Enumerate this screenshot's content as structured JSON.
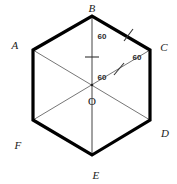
{
  "figure": {
    "background_color": "#ffffff",
    "outline_color": "#000000",
    "diagonal_color": "#555555",
    "tick_color": "#333333",
    "label_color": "#1a1a1a"
  },
  "vertices": [
    {
      "id": "A",
      "label": "A",
      "point_x": 33,
      "point_y": 50,
      "label_x": 15,
      "label_y": 45
    },
    {
      "id": "B",
      "label": "B",
      "point_x": 92,
      "point_y": 16,
      "label_x": 92,
      "label_y": 8
    },
    {
      "id": "C",
      "label": "C",
      "point_x": 150,
      "point_y": 50,
      "label_x": 164,
      "label_y": 47
    },
    {
      "id": "D",
      "label": "D",
      "point_x": 150,
      "point_y": 120,
      "label_x": 165,
      "label_y": 133
    },
    {
      "id": "E",
      "label": "E",
      "point_x": 92,
      "point_y": 155,
      "label_x": 96,
      "label_y": 175
    },
    {
      "id": "F",
      "label": "F",
      "point_x": 33,
      "point_y": 120,
      "label_x": 18,
      "label_y": 145
    }
  ],
  "center": {
    "id": "O",
    "label": "O",
    "point_x": 92,
    "point_y": 85,
    "label_x": 92,
    "label_y": 101
  },
  "angles": [
    {
      "id": "angle-bo-diagonal",
      "label": "60",
      "x": 102,
      "y": 37
    },
    {
      "id": "angle-oc-upper",
      "label": "60",
      "x": 137,
      "y": 58
    },
    {
      "id": "angle-ao-center",
      "label": "60",
      "x": 102,
      "y": 78
    }
  ],
  "diagonals": [
    {
      "id": "diagonal-AD",
      "from": "A",
      "to": "D"
    },
    {
      "id": "diagonal-BE",
      "from": "B",
      "to": "E"
    },
    {
      "id": "diagonal-CF",
      "from": "C",
      "to": "F"
    }
  ],
  "tick_marks": [
    {
      "id": "tick-segment-OB",
      "on": "OB",
      "x": 92,
      "y": 57,
      "angle": 90
    },
    {
      "id": "tick-segment-OC",
      "on": "OC",
      "x": 119,
      "y": 69,
      "angle": 150
    },
    {
      "id": "tick-side-BC",
      "on": "BC",
      "x": 128,
      "y": 35,
      "angle": 150
    }
  ]
}
